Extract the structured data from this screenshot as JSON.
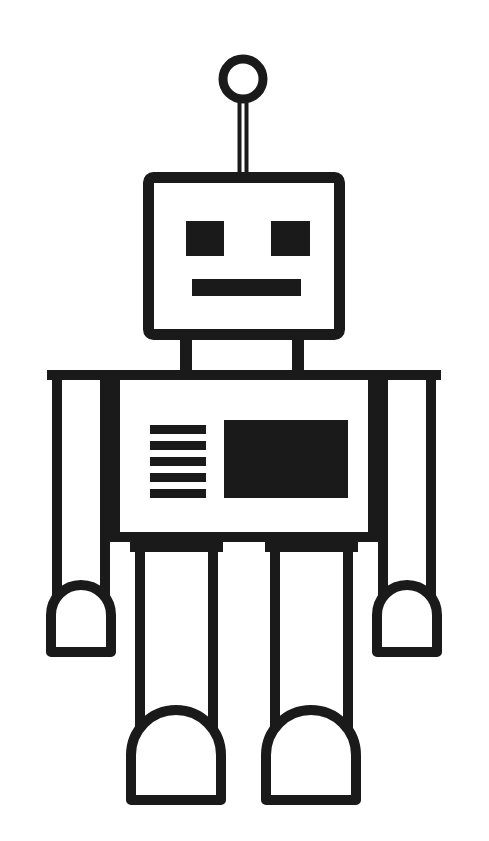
{
  "artwork": {
    "title": "Robot",
    "subject": "cartoon robot line drawing",
    "style": "black outline on white background",
    "canvas": {
      "width": 489,
      "height": 841
    },
    "colors": {
      "background": "#ffffff",
      "ink": "#1a1a1a",
      "fill": "#ffffff"
    },
    "stroke": {
      "head": 11,
      "body": 10,
      "antenna_ring": 9,
      "antenna_stem": 9,
      "limb": 10,
      "neck": 10
    }
  },
  "parts": {
    "antenna": {
      "name": "antenna",
      "ring": {
        "cx": 243,
        "cy": 79,
        "r": 20
      },
      "stem": {
        "x": 238,
        "y": 99,
        "width": 10,
        "height": 76
      }
    },
    "head": {
      "name": "head",
      "box": {
        "x": 143,
        "y": 172,
        "width": 202,
        "height": 168,
        "radius": 5
      },
      "eyes": [
        {
          "name": "eye-left",
          "x": 186,
          "y": 221,
          "width": 38,
          "height": 35
        },
        {
          "name": "eye-right",
          "x": 271,
          "y": 221,
          "width": 39,
          "height": 35
        }
      ],
      "mouth": {
        "x": 192,
        "y": 279,
        "width": 109,
        "height": 17
      }
    },
    "neck": {
      "name": "neck",
      "struts": [
        {
          "name": "neck-strut-left",
          "x": 180,
          "y": 336,
          "width": 12,
          "height": 39
        },
        {
          "name": "neck-strut-right",
          "x": 292,
          "y": 336,
          "width": 12,
          "height": 39
        }
      ]
    },
    "torso": {
      "name": "torso",
      "box": {
        "x": 110,
        "y": 370,
        "width": 268,
        "height": 172
      },
      "panel_stripes": {
        "name": "chest-stripes",
        "count": 5,
        "x": 150,
        "y_start": 425,
        "width": 56,
        "height": 9,
        "gap": 7
      },
      "screen": {
        "name": "chest-screen",
        "x": 224,
        "y": 420,
        "width": 124,
        "height": 78
      }
    },
    "arms": [
      {
        "name": "arm-left",
        "limb": {
          "x": 52,
          "y": 370,
          "width": 58,
          "height": 245
        },
        "hand": {
          "name": "hand-left",
          "cx": 81,
          "cy": 615,
          "r": 35
        }
      },
      {
        "name": "arm-right",
        "limb": {
          "x": 378,
          "y": 370,
          "width": 58,
          "height": 245
        },
        "hand": {
          "name": "hand-right",
          "cx": 407,
          "cy": 615,
          "r": 35
        }
      }
    ],
    "legs": [
      {
        "name": "leg-left",
        "limb": {
          "x": 135,
          "y": 542,
          "width": 83,
          "height": 213
        },
        "foot": {
          "name": "foot-left",
          "cx": 176,
          "cy": 755,
          "r": 50
        }
      },
      {
        "name": "leg-right",
        "limb": {
          "x": 270,
          "y": 542,
          "width": 83,
          "height": 213
        },
        "foot": {
          "name": "foot-right",
          "cx": 311,
          "cy": 755,
          "r": 50
        }
      }
    ]
  },
  "labels": {
    "figure_caption": "Robot"
  }
}
